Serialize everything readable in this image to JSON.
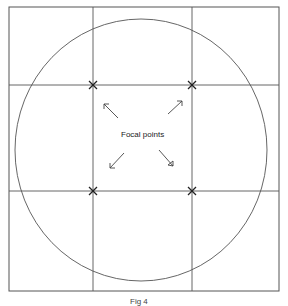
{
  "diagram": {
    "type": "rule-of-thirds composition grid",
    "center_label": "Focal points",
    "caption": "Fig 4",
    "colors": {
      "line": "#555555",
      "marker": "#222222",
      "background": "#ffffff"
    },
    "frame": {
      "x": 9,
      "y": 7,
      "width": 270,
      "height": 284
    },
    "grid": {
      "verticals": [
        93,
        192
      ],
      "horizontals": [
        85,
        191
      ]
    },
    "circle": {
      "cx": 141,
      "cy": 150,
      "rx": 126,
      "ry": 131
    },
    "focal_points": [
      {
        "name": "top-left",
        "x": 93,
        "y": 85
      },
      {
        "name": "top-right",
        "x": 192,
        "y": 85
      },
      {
        "name": "bottom-left",
        "x": 93,
        "y": 191
      },
      {
        "name": "bottom-right",
        "x": 192,
        "y": 191
      }
    ],
    "arrows": [
      {
        "direction": "up-left"
      },
      {
        "direction": "up-right"
      },
      {
        "direction": "down-left"
      },
      {
        "direction": "down-right"
      }
    ]
  }
}
